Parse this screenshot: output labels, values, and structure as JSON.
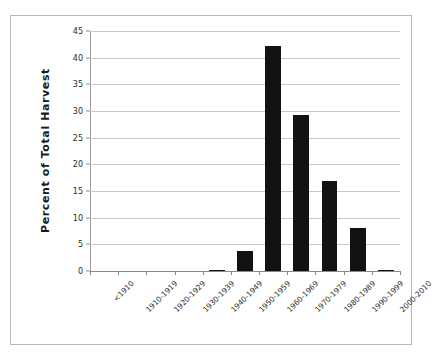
{
  "chart_data": {
    "type": "bar",
    "title": "",
    "subtitle": "",
    "xlabel": "",
    "ylabel": "Percent of Total Harvest",
    "ylim": [
      0,
      45
    ],
    "yticks": [
      0,
      5,
      10,
      15,
      20,
      25,
      30,
      35,
      40,
      45
    ],
    "ytick_labels": [
      "0",
      "5",
      "10",
      "15",
      "20",
      "25",
      "30",
      "35",
      "40",
      "45"
    ],
    "grid": "horizontal",
    "legend": "none",
    "bar_color": "#121212",
    "gridline_color": "#c8c8c8",
    "axis_color": "#8a8a8a",
    "frame_color": "#b9b9b9",
    "categories": [
      "<1910",
      "1910-1919",
      "1920-1929",
      "1930-1939",
      "1940-1949",
      "1950-1959",
      "1960-1969",
      "1970-1979",
      "1980-1989",
      "1990-1999",
      "2000-2010"
    ],
    "values": [
      0,
      0,
      0,
      0,
      0.2,
      3.8,
      42.1,
      29.3,
      16.9,
      8.1,
      0.2
    ]
  }
}
